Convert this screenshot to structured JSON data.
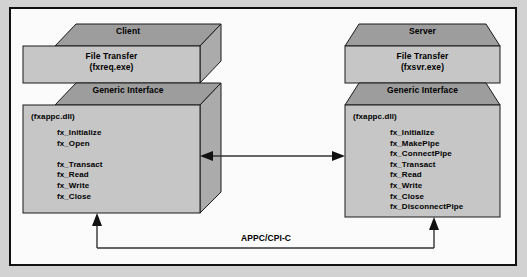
{
  "diagram": {
    "title_visible": false,
    "colors": {
      "page_background": "#d2d2d2",
      "canvas_background": "#fbfbfb",
      "frame_border": "#111111",
      "box_top_face": "#9d9d9d",
      "box_front_face": "#c6c6c6",
      "box_side_face": "#ababab",
      "outline": "#1a1a1a",
      "text": "#000000",
      "connector": "#333333"
    },
    "client": {
      "top_face_label": "Client",
      "app_box": {
        "line1": "File Transfer",
        "line2": "(fxreq.exe)"
      },
      "interface_box": {
        "top_face_label": "Generic Interface",
        "module": "(fxappc.dll)",
        "functions": [
          "fx_Initialize",
          "fx_Open",
          "",
          "fx_Transact",
          "fx_Read",
          "fx_Write",
          "fx_Close"
        ]
      }
    },
    "server": {
      "top_face_label": "Server",
      "app_box": {
        "line1": "File Transfer",
        "line2": "(fxsvr.exe)"
      },
      "interface_box": {
        "top_face_label": "Generic Interface",
        "module": "(fxappc.dll)",
        "functions": [
          "fx_Initialize",
          "fx_MakePipe",
          "fx_ConnectPipe",
          "fx_Transact",
          "fx_Read",
          "fx_Write",
          "fx_Close",
          "fx_DisconnectPipe"
        ]
      }
    },
    "connectors": {
      "interface_link_label": "",
      "protocol_link_label": "APPC/CPI-C"
    }
  }
}
